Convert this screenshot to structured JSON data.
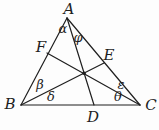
{
  "figure": {
    "vertices": {
      "A": "A",
      "B": "B",
      "C": "C"
    },
    "points": {
      "D": "D",
      "E": "E",
      "F": "F"
    },
    "angles": {
      "alpha": "α",
      "phi": "φ",
      "beta": "β",
      "delta": "δ",
      "epsilon": "ε",
      "theta": "θ"
    }
  },
  "colors": {
    "line": "#1f1f1f",
    "background": "#fdfdfd"
  }
}
